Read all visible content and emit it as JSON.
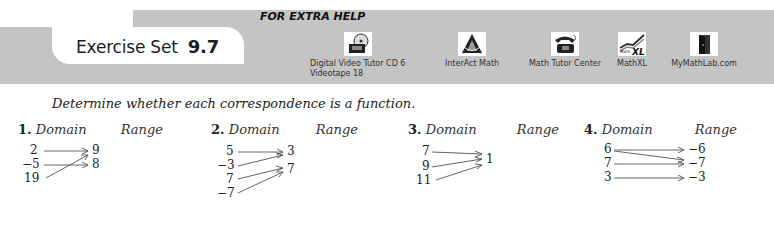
{
  "header": {
    "title": "Exercise Set",
    "section_number": "9.7",
    "extra_help_label": "FOR EXTRA HELP",
    "resources": [
      {
        "icon": "video-cd-icon",
        "label_line1": "Digital Video Tutor CD 6",
        "label_line2": "Videotape 18"
      },
      {
        "icon": "interact-math-icon",
        "label_line1": "InterAct Math"
      },
      {
        "icon": "telephone-icon",
        "label_line1": "Math Tutor Center"
      },
      {
        "icon": "mathxl-icon",
        "label_line1": "MathXL"
      },
      {
        "icon": "door-icon",
        "label_line1": "MyMathLab.com"
      }
    ],
    "colors": {
      "band": "#c4c4c4",
      "tab": "#ffffff"
    }
  },
  "instructions": "Determine whether each correspondence is a function.",
  "exercises": [
    {
      "number": "1.",
      "domain_label": "Domain",
      "range_label": "Range",
      "domain": [
        "2",
        "−5",
        "19"
      ],
      "range": [
        "9",
        "8"
      ],
      "mappings": [
        [
          "2",
          "9"
        ],
        [
          "−5",
          "8"
        ],
        [
          "19",
          "9"
        ]
      ]
    },
    {
      "number": "2.",
      "domain_label": "Domain",
      "range_label": "Range",
      "domain": [
        "5",
        "−3",
        "7",
        "−7"
      ],
      "range": [
        "3",
        "7"
      ],
      "mappings": [
        [
          "5",
          "3"
        ],
        [
          "−3",
          "3"
        ],
        [
          "7",
          "7"
        ],
        [
          "−7",
          "7"
        ]
      ]
    },
    {
      "number": "3.",
      "domain_label": "Domain",
      "range_label": "Range",
      "domain": [
        "7",
        "9",
        "11"
      ],
      "range": [
        "1"
      ],
      "mappings": [
        [
          "7",
          "1"
        ],
        [
          "9",
          "1"
        ],
        [
          "11",
          "1"
        ]
      ]
    },
    {
      "number": "4.",
      "domain_label": "Domain",
      "range_label": "Range",
      "domain": [
        "6",
        "7",
        "3"
      ],
      "range": [
        "−6",
        "−7",
        "−3"
      ],
      "mappings": [
        [
          "6",
          "−6"
        ],
        [
          "6",
          "−7"
        ],
        [
          "7",
          "−7"
        ],
        [
          "3",
          "−3"
        ]
      ]
    }
  ]
}
